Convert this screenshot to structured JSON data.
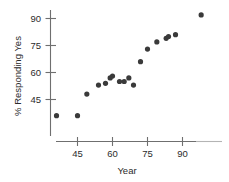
{
  "chart_data": {
    "type": "scatter",
    "title": "",
    "xlabel": "Year",
    "ylabel": "% Responding Yes",
    "xlim": [
      36,
      102
    ],
    "ylim": [
      33,
      96
    ],
    "xticks": [
      45,
      60,
      75,
      90
    ],
    "yticks": [
      45,
      60,
      75,
      90
    ],
    "grid": false,
    "legend": null,
    "points": [
      {
        "x": 36,
        "y": 36
      },
      {
        "x": 45,
        "y": 36
      },
      {
        "x": 49,
        "y": 48
      },
      {
        "x": 54,
        "y": 53
      },
      {
        "x": 57,
        "y": 54
      },
      {
        "x": 59,
        "y": 57
      },
      {
        "x": 60,
        "y": 58
      },
      {
        "x": 63,
        "y": 55
      },
      {
        "x": 65,
        "y": 55
      },
      {
        "x": 67,
        "y": 57
      },
      {
        "x": 69,
        "y": 53
      },
      {
        "x": 72,
        "y": 66
      },
      {
        "x": 75,
        "y": 73
      },
      {
        "x": 79,
        "y": 77
      },
      {
        "x": 83,
        "y": 79
      },
      {
        "x": 84,
        "y": 80
      },
      {
        "x": 87,
        "y": 81
      },
      {
        "x": 98,
        "y": 92
      }
    ]
  },
  "axes": {
    "x_tick_labels": [
      "45",
      "60",
      "75",
      "90"
    ],
    "y_tick_labels": [
      "45",
      "60",
      "75",
      "90"
    ],
    "x_axis_title": "Year",
    "y_axis_title": "% Responding Yes"
  },
  "colors": {
    "point": "#3a3a3a",
    "axis": "#6f6f6f",
    "text": "#2b2b2b",
    "background": "#ffffff"
  }
}
